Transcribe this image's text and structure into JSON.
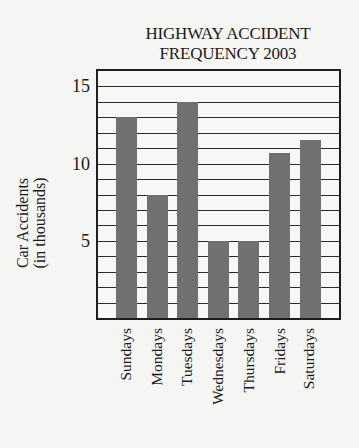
{
  "chart_data": {
    "type": "bar",
    "title": "HIGHWAY ACCIDENT FREQUENCY 2003",
    "title_lines": [
      "HIGHWAY ACCIDENT",
      "FREQUENCY 2003"
    ],
    "xlabel": "",
    "ylabel": "Car Accidents (in thousands)",
    "ylabel_lines": [
      "Car Accidents",
      "(in thousands)"
    ],
    "categories": [
      "Sundays",
      "Mondays",
      "Tuesdays",
      "Wednesdays",
      "Thursdays",
      "Fridays",
      "Saturdays"
    ],
    "values": [
      13,
      8,
      14,
      5,
      5,
      10.7,
      11.5
    ],
    "units": "thousands",
    "ylim": [
      0,
      16
    ],
    "yticks": [
      5,
      10,
      15
    ],
    "ytick_labels": [
      "5",
      "10",
      "15"
    ],
    "grid": true,
    "grid_interval": 1,
    "legend": null,
    "bar_color": "#707070",
    "grid_color": "#2a2a2a",
    "background_color": "#f5f5f3"
  }
}
